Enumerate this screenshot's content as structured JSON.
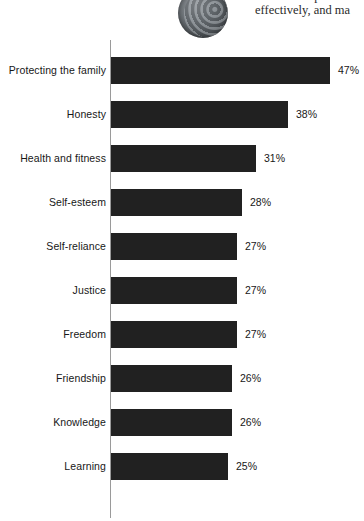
{
  "page": {
    "photo_alt": "circular-globe-photo",
    "body_text_lines": [
      "do. This helps adve",
      "effectively, and ma"
    ]
  },
  "chart_data": {
    "type": "bar",
    "orientation": "horizontal",
    "title": "",
    "subtitle": "",
    "xlabel": "",
    "ylabel": "",
    "grid": false,
    "legend": null,
    "xlim": [
      0,
      50
    ],
    "value_suffix": "%",
    "axis_line_color": "#9a9a9a",
    "bar_color": "#212121",
    "categories": [
      "Protecting the family",
      "Honesty",
      "Health and fitness",
      "Self-esteem",
      "Self-reliance",
      "Justice",
      "Freedom",
      "Friendship",
      "Knowledge",
      "Learning"
    ],
    "values": [
      47,
      38,
      31,
      28,
      27,
      27,
      27,
      26,
      26,
      25
    ],
    "data_labels": [
      "47%",
      "38%",
      "31%",
      "28%",
      "27%",
      "27%",
      "27%",
      "26%",
      "26%",
      "25%"
    ]
  }
}
